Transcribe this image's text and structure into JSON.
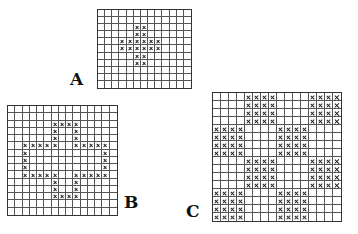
{
  "figures": [
    {
      "id": "A",
      "label": "A",
      "cols": 13,
      "rows": 11,
      "box": {
        "x": 97,
        "y": 9,
        "w": 95,
        "h": 80
      },
      "label_pos": {
        "x": 70,
        "y": 69
      },
      "marked": [
        [
          2,
          5
        ],
        [
          2,
          6
        ],
        [
          3,
          5
        ],
        [
          3,
          6
        ],
        [
          4,
          3
        ],
        [
          4,
          4
        ],
        [
          4,
          5
        ],
        [
          4,
          6
        ],
        [
          4,
          7
        ],
        [
          4,
          8
        ],
        [
          5,
          3
        ],
        [
          5,
          4
        ],
        [
          5,
          5
        ],
        [
          5,
          6
        ],
        [
          5,
          7
        ],
        [
          5,
          8
        ],
        [
          6,
          5
        ],
        [
          6,
          6
        ],
        [
          7,
          5
        ],
        [
          7,
          6
        ]
      ]
    },
    {
      "id": "B",
      "label": "B",
      "cols": 15,
      "rows": 15,
      "box": {
        "x": 7,
        "y": 105,
        "w": 111,
        "h": 111
      },
      "label_pos": {
        "x": 124,
        "y": 192
      },
      "marked": [
        [
          2,
          6
        ],
        [
          2,
          7
        ],
        [
          2,
          8
        ],
        [
          2,
          9
        ],
        [
          3,
          6
        ],
        [
          3,
          9
        ],
        [
          4,
          6
        ],
        [
          4,
          9
        ],
        [
          5,
          2
        ],
        [
          5,
          3
        ],
        [
          5,
          4
        ],
        [
          5,
          5
        ],
        [
          5,
          6
        ],
        [
          5,
          9
        ],
        [
          5,
          10
        ],
        [
          5,
          11
        ],
        [
          5,
          12
        ],
        [
          5,
          13
        ],
        [
          6,
          2
        ],
        [
          6,
          13
        ],
        [
          7,
          2
        ],
        [
          7,
          13
        ],
        [
          8,
          2
        ],
        [
          8,
          13
        ],
        [
          9,
          2
        ],
        [
          9,
          3
        ],
        [
          9,
          4
        ],
        [
          9,
          5
        ],
        [
          9,
          6
        ],
        [
          9,
          9
        ],
        [
          9,
          10
        ],
        [
          9,
          11
        ],
        [
          9,
          12
        ],
        [
          9,
          13
        ],
        [
          10,
          6
        ],
        [
          10,
          9
        ],
        [
          11,
          6
        ],
        [
          11,
          9
        ],
        [
          12,
          6
        ],
        [
          12,
          7
        ],
        [
          12,
          8
        ],
        [
          12,
          9
        ]
      ]
    },
    {
      "id": "C",
      "label": "C",
      "cols": 16,
      "rows": 16,
      "box": {
        "x": 212,
        "y": 92,
        "w": 130,
        "h": 130
      },
      "label_pos": {
        "x": 186,
        "y": 201
      },
      "pattern": "checkerboard-4x4",
      "filled_blocks": [
        [
          0,
          1
        ],
        [
          0,
          3
        ],
        [
          1,
          0
        ],
        [
          1,
          2
        ],
        [
          2,
          1
        ],
        [
          2,
          3
        ],
        [
          3,
          0
        ],
        [
          3,
          2
        ]
      ]
    }
  ]
}
